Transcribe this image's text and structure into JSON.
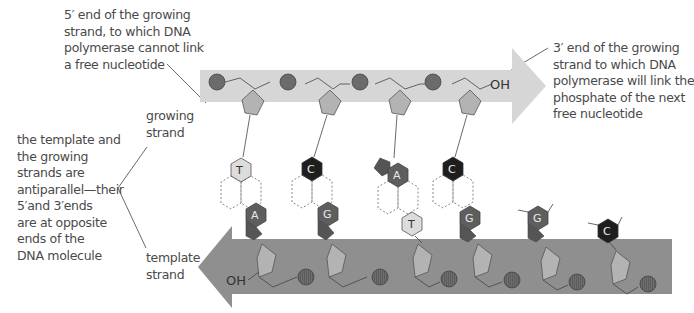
{
  "annotations": {
    "five_prime_end": [
      "5′ end of the growing",
      "strand, to which DNA",
      "polymerase cannot link",
      "a free nucleotide"
    ],
    "three_prime_end": [
      "3′ end of the growing",
      "strand to which DNA",
      "polymerase will link the",
      "phosphate of the next",
      "free nucleotide"
    ],
    "antiparallel": [
      "the template and",
      "the growing",
      "strands are",
      "antiparallel—their",
      "5′and 3′ends",
      "are at opposite",
      "ends of the",
      "DNA molecule"
    ],
    "growing_strand": [
      "growing",
      "strand"
    ],
    "template_strand": [
      "template",
      "strand"
    ]
  },
  "growing_strand": {
    "end_label": "OH",
    "band_color": "#d4d4d4",
    "bases": [
      "T",
      "C",
      "A",
      "C"
    ]
  },
  "template_strand": {
    "end_label": "OH",
    "band_color": "#8f8f8f",
    "paired_bases": [
      "A",
      "G",
      "T",
      "G"
    ],
    "unpaired_bases": [
      "G",
      "C"
    ]
  },
  "colors": {
    "phosphate": "#6b6b6b",
    "sugar": "#b3b3b3",
    "base_T": "#dcdcdc",
    "base_C": "#1e1e1e",
    "base_A": "#5e5e5e",
    "base_G": "#5e5e5e"
  }
}
